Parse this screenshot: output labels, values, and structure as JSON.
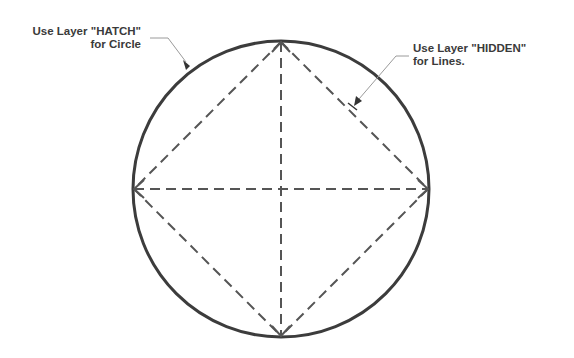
{
  "annotations": {
    "circle_note": {
      "line1": "Use Layer \"HATCH\"",
      "line2": "for Circle"
    },
    "lines_note": {
      "line1": "Use Layer \"HIDDEN\"",
      "line2": "for Lines."
    }
  },
  "drawing": {
    "circle": {
      "cx": 281,
      "cy": 189,
      "r": 148,
      "stroke": "#3c3c3c"
    },
    "dashed_stroke": "#555555",
    "leader_stroke": "#9a9a9a"
  }
}
